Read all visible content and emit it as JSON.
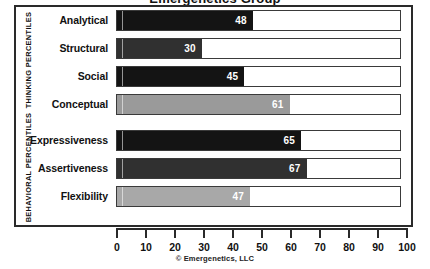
{
  "chart_data": {
    "type": "bar",
    "orientation": "horizontal",
    "title": "Emergenetics Group",
    "categories": [
      "Analytical",
      "Structural",
      "Social",
      "Conceptual",
      "Expressiveness",
      "Assertiveness",
      "Flexibility"
    ],
    "values": [
      48,
      30,
      45,
      61,
      65,
      67,
      47
    ],
    "series": [
      {
        "name": "Percentile",
        "values": [
          48,
          30,
          45,
          61,
          65,
          67,
          47
        ]
      }
    ],
    "bars": [
      {
        "label": "Analytical",
        "value": 48,
        "group": "THINKING PERCENTILES",
        "color": "#141414"
      },
      {
        "label": "Structural",
        "value": 30,
        "group": "THINKING PERCENTILES",
        "color": "#303030"
      },
      {
        "label": "Social",
        "value": 45,
        "group": "THINKING PERCENTILES",
        "color": "#141414"
      },
      {
        "label": "Conceptual",
        "value": 61,
        "group": "THINKING PERCENTILES",
        "color": "#9a9a9a"
      },
      {
        "label": "Expressiveness",
        "value": 65,
        "group": "BEHAVIORAL PERCENTILES",
        "color": "#141414"
      },
      {
        "label": "Assertiveness",
        "value": 67,
        "group": "BEHAVIORAL PERCENTILES",
        "color": "#303030"
      },
      {
        "label": "Flexibility",
        "value": 47,
        "group": "BEHAVIORAL PERCENTILES",
        "color": "#a8a8a8"
      }
    ],
    "groups": [
      {
        "name": "THINKING PERCENTILES",
        "rows": [
          0,
          1,
          2,
          3
        ]
      },
      {
        "name": "BEHAVIORAL PERCENTILES",
        "rows": [
          4,
          5,
          6
        ]
      }
    ],
    "xlabel": "",
    "ylabel": "",
    "xlim": [
      0,
      100
    ],
    "xticks": [
      0,
      10,
      20,
      30,
      40,
      50,
      60,
      70,
      80,
      90,
      100
    ],
    "xtick_labels": [
      "0",
      "10",
      "20",
      "30",
      "40",
      "50",
      "60",
      "70",
      "80",
      "90",
      "100"
    ],
    "grid": false,
    "legend": false,
    "data_labels": true,
    "footnote": "© Emergenetics, LLC"
  },
  "axis_labels": {
    "thinking": "THINKING PERCENTILES",
    "behavioral": "BEHAVIORAL PERCENTILES"
  },
  "footer": {
    "copyright": "© Emergenetics, LLC"
  }
}
